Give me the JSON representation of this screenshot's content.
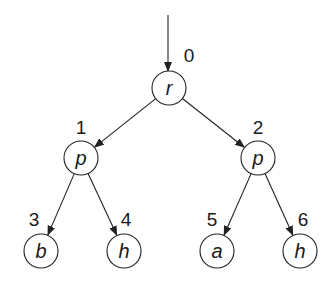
{
  "diagram": {
    "type": "tree",
    "root_arrow": {
      "x": 168,
      "y1": 15,
      "y2": 71
    },
    "nodes": [
      {
        "id": 0,
        "label": "r",
        "index": "0",
        "cx": 169,
        "cy": 88,
        "r": 17,
        "ix": 189,
        "iy": 62
      },
      {
        "id": 1,
        "label": "p",
        "index": "1",
        "cx": 81,
        "cy": 158,
        "r": 17,
        "ix": 81,
        "iy": 134
      },
      {
        "id": 2,
        "label": "p",
        "index": "2",
        "cx": 258,
        "cy": 158,
        "r": 17,
        "ix": 258,
        "iy": 134
      },
      {
        "id": 3,
        "label": "b",
        "index": "3",
        "cx": 41,
        "cy": 251,
        "r": 17,
        "ix": 34,
        "iy": 226
      },
      {
        "id": 4,
        "label": "h",
        "index": "4",
        "cx": 124,
        "cy": 251,
        "r": 17,
        "ix": 126,
        "iy": 226
      },
      {
        "id": 5,
        "label": "a",
        "index": "5",
        "cx": 217,
        "cy": 251,
        "r": 17,
        "ix": 212,
        "iy": 226
      },
      {
        "id": 6,
        "label": "h",
        "index": "6",
        "cx": 300,
        "cy": 251,
        "r": 17,
        "ix": 303,
        "iy": 226
      }
    ],
    "edges": [
      {
        "from": 0,
        "to": 1
      },
      {
        "from": 0,
        "to": 2
      },
      {
        "from": 1,
        "to": 3
      },
      {
        "from": 1,
        "to": 4
      },
      {
        "from": 2,
        "to": 5
      },
      {
        "from": 2,
        "to": 6
      }
    ],
    "colors": {
      "stroke": "#222222",
      "background": "#ffffff"
    }
  }
}
